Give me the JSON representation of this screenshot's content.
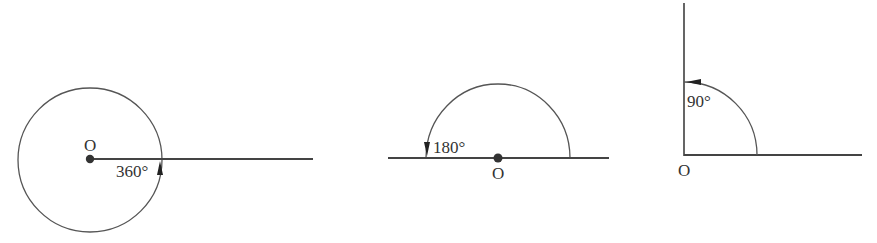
{
  "colors": {
    "stroke": "#555555",
    "ray": "#444444",
    "text": "#333333",
    "point": "#333333",
    "background": "#ffffff"
  },
  "figures": [
    {
      "id": "full-angle",
      "type": "full-circle",
      "vertex_label": "O",
      "angle_label": "360°",
      "angle_degrees": 360
    },
    {
      "id": "straight-angle",
      "type": "semicircle",
      "vertex_label": "O",
      "angle_label": "180°",
      "angle_degrees": 180
    },
    {
      "id": "right-angle",
      "type": "quarter-circle",
      "vertex_label": "O",
      "angle_label": "90°",
      "angle_degrees": 90
    }
  ]
}
